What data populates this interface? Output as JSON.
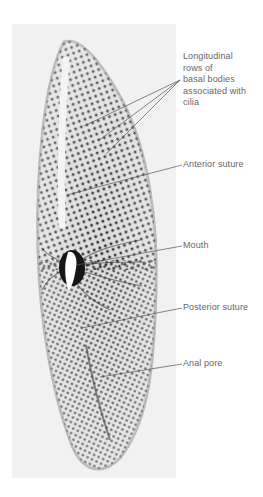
{
  "figure": {
    "colors": {
      "background": "#ffffff",
      "photo_background": "#f1f1f1",
      "label_text": "#666666",
      "leader_line": "#555555",
      "cell_dots": "#2a2a2a"
    },
    "labels": [
      {
        "id": "basal-bodies",
        "text": "Longitudinal\nrows of\nbasal bodies\nassociated with\ncilia",
        "top": 51,
        "pointers": [
          [
            84,
            126
          ],
          [
            98,
            141
          ],
          [
            106,
            154
          ]
        ],
        "anchor": [
          180,
          80
        ]
      },
      {
        "id": "anterior-suture",
        "text": "Anterior suture",
        "top": 159,
        "pointers": [
          [
            67,
            195
          ]
        ],
        "anchor": [
          182,
          165
        ]
      },
      {
        "id": "mouth",
        "text": "Mouth",
        "top": 240,
        "pointers": [
          [
            77,
            265
          ]
        ],
        "anchor": [
          182,
          246
        ]
      },
      {
        "id": "posterior-suture",
        "text": "Posterior suture",
        "top": 302,
        "pointers": [
          [
            82,
            328
          ]
        ],
        "anchor": [
          182,
          308
        ]
      },
      {
        "id": "anal-pore",
        "text": "Anal pore",
        "top": 358,
        "pointers": [
          [
            100,
            377
          ]
        ],
        "anchor": [
          182,
          364
        ]
      }
    ]
  }
}
